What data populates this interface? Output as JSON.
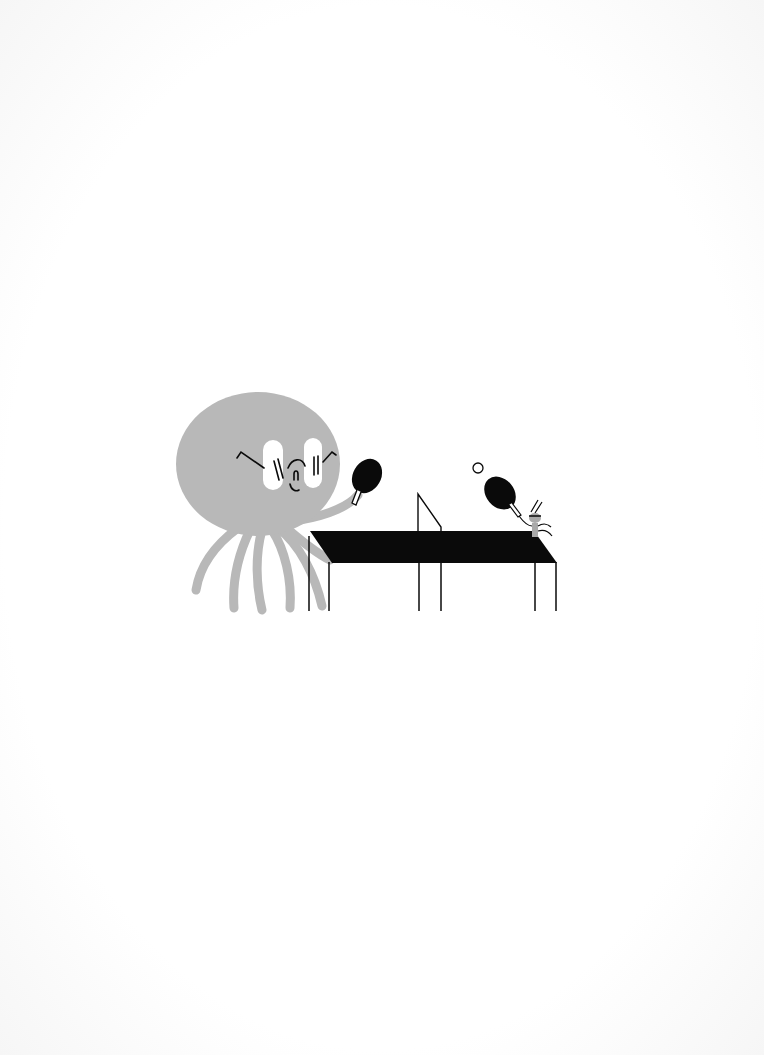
{
  "page": {
    "type": "scanned-illustration-page",
    "text": ""
  },
  "illustration": {
    "description": "A large grey octopus-like creature with glasses plays table tennis against a tiny bug-like creature at a black ping-pong table",
    "colors": {
      "background": "#fdfdfd",
      "creature_body": "#b8b8b8",
      "ink": "#0a0a0a",
      "highlight": "#ffffff",
      "small_creature": "#a9a9a9"
    },
    "elements": [
      "octopus-creature",
      "octopus-paddle",
      "ping-pong-table",
      "table-net",
      "ping-pong-ball",
      "bug-creature",
      "bug-paddle"
    ]
  }
}
